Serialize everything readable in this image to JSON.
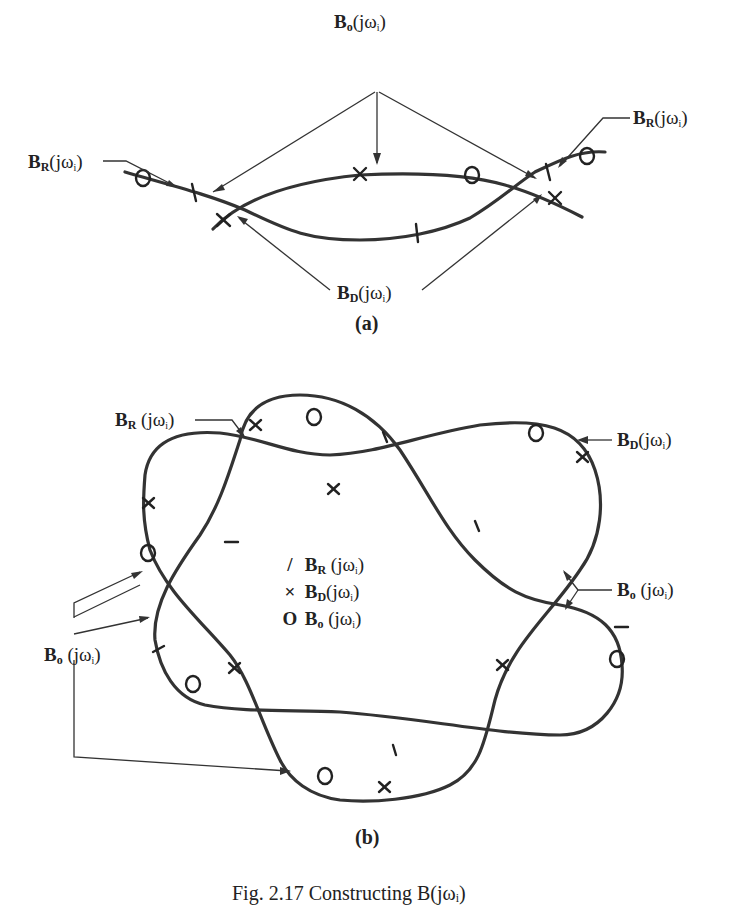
{
  "panel_a": {
    "label": "(a)",
    "labels": {
      "bo_top": {
        "sym": "B",
        "sub": "o",
        "arg": "(jω",
        "argsub": "i",
        "close": ")"
      },
      "br_left": {
        "sym": "B",
        "sub": "R",
        "arg": "(jω",
        "argsub": "i",
        "close": ")"
      },
      "br_right": {
        "sym": "B",
        "sub": "R",
        "arg": "(jω",
        "argsub": "i",
        "close": ")"
      },
      "bd_bottom": {
        "sym": "B",
        "sub": "D",
        "arg": "(jω",
        "argsub": "i",
        "close": ")"
      }
    }
  },
  "panel_b": {
    "label": "(b)",
    "labels": {
      "br_top": {
        "sym": "B",
        "sub": "R",
        "arg": " (jω",
        "argsub": "i",
        "close": ")"
      },
      "bd_right": {
        "sym": "B",
        "sub": "D",
        "arg": "(jω",
        "argsub": "i",
        "close": ")"
      },
      "bo_right": {
        "sym": "B",
        "sub": "o",
        "arg": " (jω",
        "argsub": "i",
        "close": ")"
      },
      "bo_left": {
        "sym": "B",
        "sub": "o",
        "arg": " (jω",
        "argsub": "i",
        "close": ")"
      }
    },
    "legend": [
      {
        "marker": "/",
        "sym": "B",
        "sub": "R",
        "arg": " (jω",
        "argsub": "i",
        "close": ")"
      },
      {
        "marker": "×",
        "sym": "B",
        "sub": "D",
        "arg": "(jω",
        "argsub": "i",
        "close": ")"
      },
      {
        "marker": "O",
        "sym": "B",
        "sub": "o",
        "arg": " (jω",
        "argsub": "i",
        "close": ")"
      }
    ]
  },
  "caption": "Fig. 2.17  Constructing B(jωᵢ)"
}
